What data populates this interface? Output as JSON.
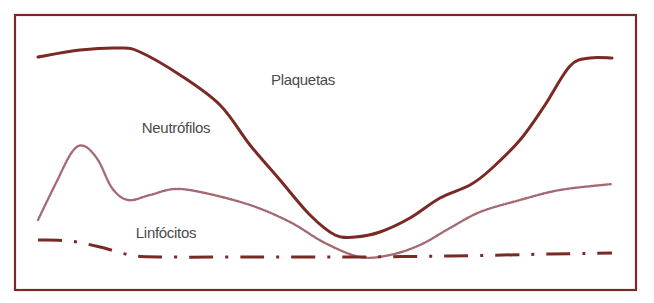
{
  "chart_data": {
    "type": "line",
    "title": "",
    "xlabel": "",
    "ylabel": "",
    "grid": false,
    "legend": "inline labels",
    "frame": {
      "x": 15,
      "y": 15,
      "width": 621,
      "height": 275,
      "color": "#7a2a24"
    },
    "annotations": [
      {
        "text": "Plaquetas",
        "x": 303,
        "y": 85,
        "series": "Plaquetas"
      },
      {
        "text": "Neutrófilos",
        "x": 176,
        "y": 133,
        "series": "Neutrófilos"
      },
      {
        "text": "Linfócitos",
        "x": 166,
        "y": 238,
        "series": "Linfócitos"
      }
    ],
    "series": [
      {
        "name": "Plaquetas",
        "style": "solid",
        "color": "#7a2a24",
        "points": [
          [
            38,
            57
          ],
          [
            80,
            50
          ],
          [
            120,
            48
          ],
          [
            140,
            52
          ],
          [
            180,
            75
          ],
          [
            220,
            105
          ],
          [
            250,
            145
          ],
          [
            280,
            180
          ],
          [
            310,
            215
          ],
          [
            335,
            235
          ],
          [
            355,
            237
          ],
          [
            380,
            232
          ],
          [
            410,
            218
          ],
          [
            440,
            198
          ],
          [
            470,
            185
          ],
          [
            490,
            170
          ],
          [
            520,
            140
          ],
          [
            545,
            105
          ],
          [
            570,
            66
          ],
          [
            590,
            58
          ],
          [
            612,
            58
          ]
        ]
      },
      {
        "name": "Neutrófilos",
        "style": "dotted",
        "color": "#a46a74",
        "points": [
          [
            38,
            220
          ],
          [
            55,
            185
          ],
          [
            72,
            152
          ],
          [
            84,
            146
          ],
          [
            98,
            160
          ],
          [
            112,
            188
          ],
          [
            128,
            200
          ],
          [
            150,
            195
          ],
          [
            175,
            189
          ],
          [
            205,
            193
          ],
          [
            250,
            205
          ],
          [
            290,
            222
          ],
          [
            325,
            243
          ],
          [
            360,
            257
          ],
          [
            390,
            255
          ],
          [
            420,
            245
          ],
          [
            450,
            228
          ],
          [
            480,
            212
          ],
          [
            520,
            200
          ],
          [
            560,
            190
          ],
          [
            612,
            184
          ]
        ]
      },
      {
        "name": "Linfócitos",
        "style": "dash-dot",
        "color": "#7a2a24",
        "points": [
          [
            38,
            240
          ],
          [
            70,
            241
          ],
          [
            100,
            247
          ],
          [
            130,
            255
          ],
          [
            160,
            257
          ],
          [
            250,
            257
          ],
          [
            350,
            257
          ],
          [
            450,
            256
          ],
          [
            550,
            254
          ],
          [
            612,
            253
          ]
        ]
      }
    ]
  }
}
